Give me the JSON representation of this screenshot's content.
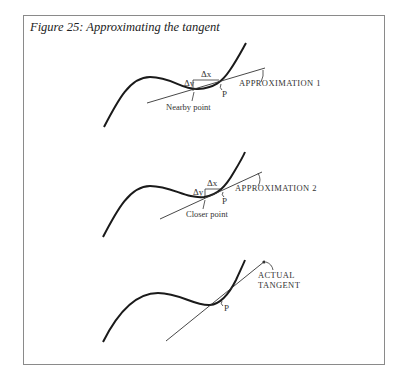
{
  "caption": "Figure 25: Approximating the tangent",
  "panels": [
    {
      "line_label": "APPROXIMATION 1",
      "point_label": "Nearby point",
      "p_label": "P",
      "dx_label": "Δx",
      "dy_label": "Δy"
    },
    {
      "line_label": "APPROXIMATION 2",
      "point_label": "Closer point",
      "p_label": "P",
      "dx_label": "Δx",
      "dy_label": "Δy"
    },
    {
      "line_label_1": "ACTUAL",
      "line_label_2": "TANGENT",
      "p_label": "P"
    }
  ],
  "colors": {
    "ink": "#1a1a1a",
    "border": "#8a8a8a"
  }
}
